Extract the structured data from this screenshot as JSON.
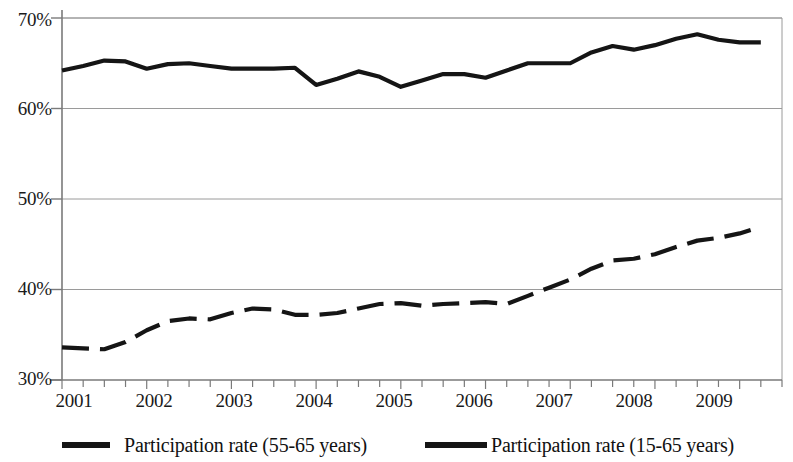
{
  "chart_data": {
    "type": "line",
    "title": "",
    "subtitle": "",
    "xlabel": "",
    "ylabel": "",
    "xlim": [
      2001.0,
      2009.5
    ],
    "ylim": [
      30,
      70
    ],
    "yticks": [
      30,
      40,
      50,
      60,
      70
    ],
    "ytick_labels": [
      "30%",
      "40%",
      "50%",
      "60%",
      "70%"
    ],
    "xticks": [
      2001,
      2002,
      2003,
      2004,
      2005,
      2006,
      2007,
      2008,
      2009
    ],
    "xtick_labels": [
      "2001",
      "2002",
      "2003",
      "2004",
      "2005",
      "2006",
      "2007",
      "2008",
      "2009"
    ],
    "minor_xticks_per_year": 4,
    "grid": "horizontal",
    "legend_position": "below",
    "x": [
      2001.0,
      2001.25,
      2001.5,
      2001.75,
      2002.0,
      2002.25,
      2002.5,
      2002.75,
      2003.0,
      2003.25,
      2003.5,
      2003.75,
      2004.0,
      2004.25,
      2004.5,
      2004.75,
      2005.0,
      2005.25,
      2005.5,
      2005.75,
      2006.0,
      2006.25,
      2006.5,
      2006.75,
      2007.0,
      2007.25,
      2007.5,
      2007.75,
      2008.0,
      2008.25,
      2008.5,
      2008.75,
      2009.0,
      2009.25
    ],
    "series": [
      {
        "name": "Participation rate (55-65 years)",
        "style": "dashed",
        "color": "#151515",
        "values": [
          33.6,
          33.5,
          33.4,
          34.2,
          35.5,
          36.5,
          36.8,
          36.7,
          37.4,
          37.9,
          37.8,
          37.2,
          37.2,
          37.4,
          37.9,
          38.4,
          38.5,
          38.2,
          38.4,
          38.5,
          38.6,
          38.4,
          39.3,
          40.2,
          41.1,
          42.3,
          43.2,
          43.4,
          43.9,
          44.7,
          45.4,
          45.7,
          46.2,
          46.9
        ]
      },
      {
        "name": "Participation rate (15-65 years)",
        "style": "solid",
        "color": "#151515",
        "values": [
          64.2,
          64.7,
          65.3,
          65.2,
          64.4,
          64.9,
          65.0,
          64.7,
          64.4,
          64.4,
          64.4,
          64.5,
          62.6,
          63.3,
          64.1,
          63.5,
          62.4,
          63.1,
          63.8,
          63.8,
          63.4,
          64.2,
          65.0,
          65.0,
          65.0,
          66.2,
          66.9,
          66.5,
          67.0,
          67.7,
          68.2,
          67.6,
          67.3,
          67.3
        ]
      }
    ]
  },
  "legend": {
    "items": [
      {
        "label": "Participation rate (55-65 years)",
        "marker": "dashed-line-swatch"
      },
      {
        "label": "Participation rate (15-65 years)",
        "marker": "solid-line-swatch"
      }
    ]
  },
  "axes": {
    "axis_color": "#7a7a7a",
    "gridline_color": "#9a9a9a",
    "tick_label_color": "#1a1a1a",
    "background": "#ffffff"
  }
}
